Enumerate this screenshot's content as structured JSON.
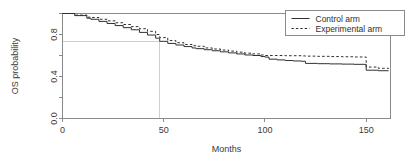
{
  "chart_data": {
    "type": "line",
    "title": "",
    "subtitle": "",
    "xlabel": "Months",
    "ylabel": "OS probability",
    "xlim": [
      0,
      162
    ],
    "ylim": [
      0.0,
      1.0
    ],
    "xticks": [
      0,
      50,
      100,
      150
    ],
    "xtick_labels": [
      "0",
      "50",
      "100",
      "150"
    ],
    "yticks": [
      0.0,
      0.2,
      0.4,
      0.6,
      0.8,
      1.0
    ],
    "ytick_labels": [
      "0.0",
      "",
      "0.4",
      "",
      "0.8",
      ""
    ],
    "ytick_labels_shown": [
      "0.0",
      "0.4",
      "0.8"
    ],
    "grid": false,
    "legend_position": "top-right",
    "annotations": [
      {
        "name": "median-reference-lines",
        "type": "reference-crosshair",
        "x": 48,
        "y": 0.73,
        "color": "#cfcfcf",
        "description": "horizontal line at OS probability 0.73 from y-axis to 48 months, vertical line at 48 months down to x-axis"
      }
    ],
    "series": [
      {
        "name": "Control arm",
        "style": "solid",
        "color": "#303030",
        "x": [
          0,
          6,
          12,
          14,
          18,
          22,
          26,
          30,
          34,
          38,
          42,
          46,
          48,
          52,
          56,
          60,
          64,
          66,
          70,
          74,
          78,
          82,
          86,
          90,
          94,
          98,
          100,
          102,
          106,
          110,
          114,
          118,
          120,
          126,
          132,
          138,
          144,
          149,
          150,
          156,
          161
        ],
        "y": [
          1.0,
          0.98,
          0.955,
          0.945,
          0.925,
          0.905,
          0.885,
          0.865,
          0.845,
          0.82,
          0.795,
          0.765,
          0.735,
          0.715,
          0.7,
          0.685,
          0.672,
          0.665,
          0.655,
          0.645,
          0.635,
          0.625,
          0.615,
          0.605,
          0.6,
          0.59,
          0.585,
          0.565,
          0.558,
          0.552,
          0.548,
          0.545,
          0.525,
          0.522,
          0.52,
          0.518,
          0.516,
          0.515,
          0.46,
          0.455,
          0.452
        ]
      },
      {
        "name": "Experimental arm",
        "style": "dashed",
        "color": "#303030",
        "x": [
          0,
          6,
          12,
          14,
          18,
          22,
          26,
          30,
          34,
          38,
          42,
          46,
          48,
          52,
          56,
          60,
          64,
          66,
          70,
          74,
          78,
          82,
          86,
          90,
          94,
          98,
          100,
          102,
          106,
          110,
          114,
          118,
          120,
          126,
          132,
          138,
          144,
          149,
          150,
          156,
          161
        ],
        "y": [
          1.0,
          0.985,
          0.965,
          0.962,
          0.945,
          0.93,
          0.912,
          0.895,
          0.875,
          0.855,
          0.83,
          0.8,
          0.77,
          0.742,
          0.722,
          0.705,
          0.693,
          0.688,
          0.672,
          0.662,
          0.652,
          0.642,
          0.632,
          0.622,
          0.615,
          0.605,
          0.6,
          0.6,
          0.6,
          0.598,
          0.598,
          0.596,
          0.594,
          0.592,
          0.59,
          0.588,
          0.586,
          0.585,
          0.49,
          0.478,
          0.472
        ]
      }
    ]
  },
  "legend": {
    "entries": [
      {
        "label": "Control arm",
        "style": "solid"
      },
      {
        "label": "Experimental arm",
        "style": "dashed"
      }
    ]
  },
  "axes": {
    "x_title": "Months",
    "y_title": "OS probability",
    "x_tick_0": "0",
    "x_tick_1": "50",
    "x_tick_2": "100",
    "x_tick_3": "150",
    "y_tick_0": "0.0",
    "y_tick_1": "0.4",
    "y_tick_2": "0.8"
  },
  "colors": {
    "background": "#ffffff",
    "axis": "#8a8a8a",
    "curve": "#303030",
    "reference": "#cfcfcf",
    "text": "#3a3a3a"
  }
}
